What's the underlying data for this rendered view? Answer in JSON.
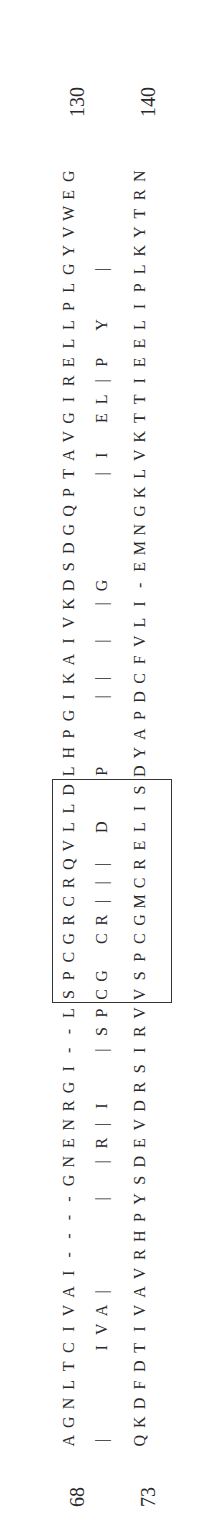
{
  "figure": {
    "type": "pairwise sequence alignment",
    "orientation": "rotated 90 degrees counter-clockwise"
  },
  "alignment": {
    "top": {
      "start": "68",
      "end": "130",
      "sequence": "AGNLTCIVAI----GNENRGI--LSPCGRCRQVLLDLHPGIKAIVKDSDGQPTAVGIRELLPLGYVWEG"
    },
    "match": {
      "sequence": "|    IVA|    | |R|I  |SPCG CR||| D  P   || | |G     |I EL|P Y  |"
    },
    "bottom": {
      "start": "73",
      "end": "140",
      "sequence": "QKDFDTIVAVRHPYSDEVDRSIRVVSPCGMCRELISDYAPDCFVLI-EMNGKLVKTTIEELIPLKYTRN"
    }
  },
  "annotations": {
    "boxed_region": {
      "top": "LSPCGRCRQVL",
      "match": "|SPCG CR|||",
      "bottom": "VSPCGMCRELI"
    },
    "markers": [
      {
        "shape": "triangle-down-icon",
        "position": "above top sequence"
      },
      {
        "shape": "triangle-down-icon",
        "position": "above top sequence"
      },
      {
        "shape": "triangle-up-icon",
        "position": "below bottom sequence"
      },
      {
        "shape": "triangle-up-icon",
        "position": "below bottom sequence"
      }
    ]
  },
  "colors": {
    "text": "#2a2a2a",
    "background": "#ffffff"
  }
}
